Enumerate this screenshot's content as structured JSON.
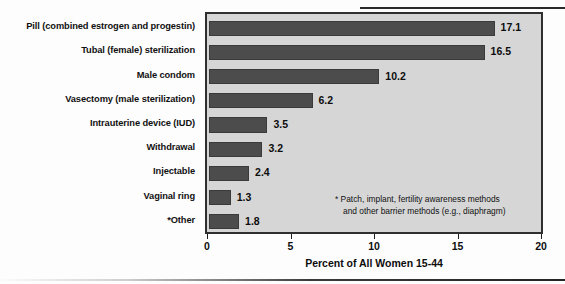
{
  "chart_data": {
    "type": "bar",
    "orientation": "horizontal",
    "title": "",
    "xlabel": "Percent of All Women 15-44",
    "ylabel": "",
    "xlim": [
      0,
      20
    ],
    "xticks": [
      0,
      5,
      10,
      15,
      20
    ],
    "xtick_labels": [
      "0",
      "5",
      "10",
      "15",
      "20"
    ],
    "grid": false,
    "legend": null,
    "categories": [
      "Pill (combined estrogen and progestin)",
      "Tubal (female) sterilization",
      "Male condom",
      "Vasectomy (male sterilization)",
      "Intrauterine device (IUD)",
      "Withdrawal",
      "Injectable",
      "Vaginal ring",
      "*Other"
    ],
    "values": [
      17.1,
      16.5,
      10.2,
      6.2,
      3.5,
      3.2,
      2.4,
      1.3,
      1.8
    ],
    "value_labels": [
      "17.1",
      "16.5",
      "10.2",
      "6.2",
      "3.5",
      "3.2",
      "2.4",
      "1.3",
      "1.8"
    ],
    "annotations": [
      "* Patch, implant, fertility awareness methods",
      "and other barrier methods (e.g., diaphragm)"
    ],
    "colors": {
      "bar": "#4c4c4c",
      "bar_edge": "#3a3a3a",
      "plot_background": "#d6d6d6",
      "plot_border": "#2f2f2f",
      "page_background": "#fdfdfd",
      "text": "#0d0d0d"
    }
  }
}
